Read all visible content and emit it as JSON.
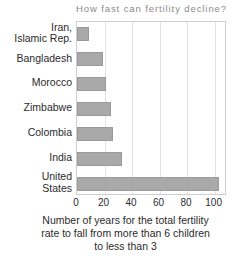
{
  "chart_data": {
    "type": "bar",
    "orientation": "horizontal",
    "title": "How fast can fertility decline?",
    "xlabel": "Number of years for the total fertility rate to fall from more than 6 children to less than 3",
    "ylabel": "",
    "categories": [
      "Iran, Islamic Rep.",
      "Bangladesh",
      "Morocco",
      "Zimbabwe",
      "Colombia",
      "India",
      "United States"
    ],
    "category_lines": [
      [
        "Iran,",
        "Islamic Rep."
      ],
      [
        "Bangladesh"
      ],
      [
        "Morocco"
      ],
      [
        "Zimbabwe"
      ],
      [
        "Colombia"
      ],
      [
        "India"
      ],
      [
        "United",
        "States"
      ]
    ],
    "values": [
      9,
      19,
      21,
      25,
      26,
      33,
      103
    ],
    "xlim": [
      0,
      109
    ],
    "xticks": [
      0,
      20,
      40,
      60,
      80,
      100
    ],
    "xtick_labels": [
      "0",
      "20",
      "40",
      "60",
      "80",
      "100"
    ],
    "grid": "vertical",
    "legend": "none",
    "bar_color": "#a9a9a9",
    "bar_edge_color": "#9a9a9a",
    "frame_color": "#cfcfcf",
    "grid_color": "#e2e2e2",
    "title_color": "#8a8a8a",
    "text_color": "#2b2b2b"
  },
  "caption": {
    "line1": "Number of years for the total fertility",
    "line2": "rate to fall from more than 6 children",
    "line3": "to less than 3"
  }
}
